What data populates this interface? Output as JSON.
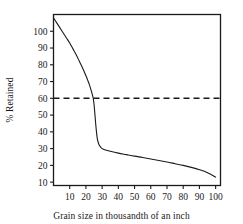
{
  "chart_data": {
    "type": "line",
    "title": "",
    "xlabel": "Grain size in thousandth of an inch",
    "ylabel": "% Retained",
    "xlim": [
      0,
      103
    ],
    "ylim": [
      8,
      110
    ],
    "grid": false,
    "legend": "none",
    "x_ticks": [
      10,
      20,
      30,
      40,
      50,
      60,
      70,
      80,
      90,
      100
    ],
    "y_ticks": [
      10,
      20,
      30,
      40,
      50,
      60,
      70,
      80,
      90,
      100
    ],
    "x_tick_labels": [
      "10",
      "20",
      "30",
      "40",
      "50",
      "60",
      "70",
      "80",
      "90",
      "100"
    ],
    "y_tick_labels": [
      "10",
      "20",
      "30",
      "40",
      "50",
      "60",
      "70",
      "80",
      "90",
      "100"
    ],
    "series": [
      {
        "name": "retained-curve",
        "style": "solid",
        "color": "#1a1a1a",
        "x": [
          0,
          2,
          4,
          6,
          8,
          10,
          12,
          14,
          16,
          18,
          20,
          21,
          22,
          23,
          24,
          24.5,
          25,
          25.5,
          26,
          26.5,
          27,
          27.5,
          28,
          29,
          30,
          32,
          35,
          40,
          45,
          50,
          55,
          60,
          65,
          70,
          75,
          80,
          85,
          90,
          95,
          100
        ],
        "y": [
          108,
          105,
          102,
          99,
          96,
          93,
          89.5,
          86,
          82,
          78,
          73.5,
          71,
          68.5,
          65.5,
          62,
          60,
          56.5,
          51,
          45,
          40,
          36,
          34,
          32.5,
          31,
          30,
          29.2,
          28.4,
          27.3,
          26.4,
          25.5,
          24.7,
          23.8,
          22.9,
          22,
          21,
          20,
          18.8,
          17.4,
          15.6,
          13
        ]
      },
      {
        "name": "threshold-line",
        "style": "dashed",
        "color": "#1a1a1a",
        "value": 60,
        "x": [
          0,
          103
        ],
        "y": [
          60,
          60
        ]
      }
    ],
    "annotations": [
      {
        "label": "60% retained threshold",
        "y": 60
      }
    ]
  },
  "labels": {
    "x_axis_title": "Grain size in thousandth of an inch",
    "y_axis_title": "% Retained"
  }
}
